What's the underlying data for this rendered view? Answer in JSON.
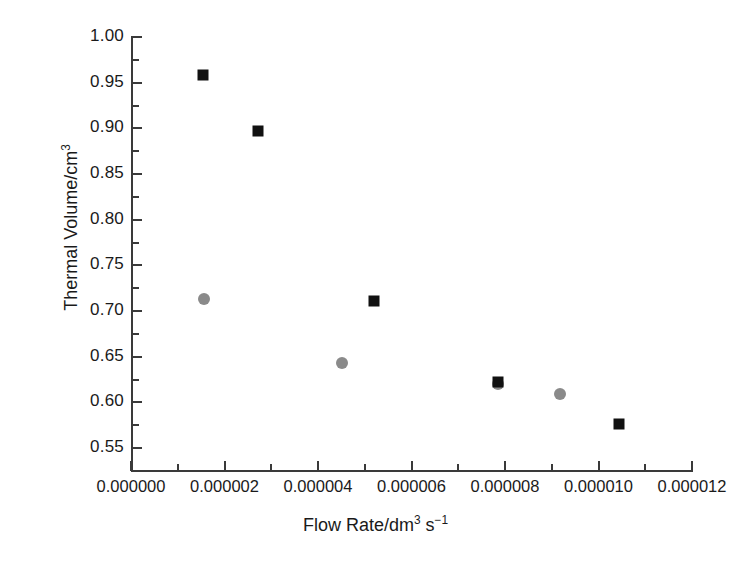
{
  "chart_data": {
    "type": "scatter",
    "title": "",
    "xlabel": "Flow Rate/dm3 s-1",
    "xlabel_parts": {
      "pre": "Flow Rate/dm",
      "sup1": "3",
      "mid": " s",
      "sup2": "−1"
    },
    "ylabel": "Thermal Volume/cm3",
    "ylabel_parts": {
      "pre": "Thermal Volume/cm",
      "sup1": "3"
    },
    "xlim": [
      0.0,
      1.2e-05
    ],
    "ylim": [
      0.525,
      1.0
    ],
    "grid": false,
    "legend": "none",
    "xticks": [
      0.0,
      2e-06,
      4e-06,
      6e-06,
      8e-06,
      1e-05,
      1.2e-05
    ],
    "xticklabels": [
      "0.000000",
      "0.000002",
      "0.000004",
      "0.000006",
      "0.000008",
      "0.000010",
      "0.000012"
    ],
    "x_minor_ticks": [
      1e-06,
      3e-06,
      5e-06,
      7e-06,
      9e-06,
      1.1e-05
    ],
    "yticks": [
      0.55,
      0.6,
      0.65,
      0.7,
      0.75,
      0.8,
      0.85,
      0.9,
      0.95,
      1.0
    ],
    "yticklabels": [
      "0.55",
      "0.60",
      "0.65",
      "0.70",
      "0.75",
      "0.80",
      "0.85",
      "0.90",
      "0.95",
      "1.00"
    ],
    "y_minor_ticks": [
      0.575,
      0.625,
      0.675,
      0.725,
      0.775,
      0.825,
      0.875,
      0.925,
      0.975
    ],
    "series": [
      {
        "name": "black-squares",
        "marker": "square",
        "color": "#111111",
        "points": [
          {
            "x": 1.54e-06,
            "y": 0.958
          },
          {
            "x": 2.72e-06,
            "y": 0.897
          },
          {
            "x": 5.2e-06,
            "y": 0.711
          },
          {
            "x": 7.85e-06,
            "y": 0.622
          },
          {
            "x": 1.044e-05,
            "y": 0.576
          }
        ]
      },
      {
        "name": "gray-circles",
        "marker": "circle",
        "color": "#8a8a8a",
        "points": [
          {
            "x": 1.56e-06,
            "y": 0.713
          },
          {
            "x": 4.51e-06,
            "y": 0.643
          },
          {
            "x": 7.85e-06,
            "y": 0.62
          },
          {
            "x": 9.18e-06,
            "y": 0.609
          }
        ]
      }
    ]
  }
}
